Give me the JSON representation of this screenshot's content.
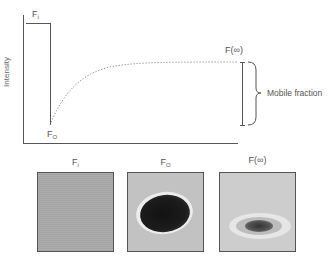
{
  "graph": {
    "ylabel": "Intensity",
    "labels": {
      "f_initial_main": "F",
      "f_initial_sub": "i",
      "f_zero_main": "F",
      "f_zero_sub": "O",
      "f_infinity": "F(∞)",
      "mobile_fraction": "Mobile fraction"
    },
    "curve": {
      "type": "exponential recovery",
      "prebleach_level": "F_i",
      "postbleach_level": "F_O",
      "plateau_level": "F(∞)",
      "style": "dotted"
    }
  },
  "panels": [
    {
      "label_main": "F",
      "label_sub": "i",
      "description": "uniform gray field before bleaching"
    },
    {
      "label_main": "F",
      "label_sub": "O",
      "description": "dark bleached oval with light halo immediately after bleaching"
    },
    {
      "label_main": "F(∞)",
      "label_sub": "",
      "description": "small faint dark spot with pale halo after recovery"
    }
  ],
  "colors": {
    "axis": "#555555",
    "curve": "#888888",
    "panel1_bg": "#a9a9a9",
    "panel2_bg": "#c2c2c2",
    "panel2_spot": "#1e1e1e",
    "panel3_bg": "#cdcdcd",
    "panel3_spot": "#3a3a3a",
    "halo": "#eeeeee"
  }
}
